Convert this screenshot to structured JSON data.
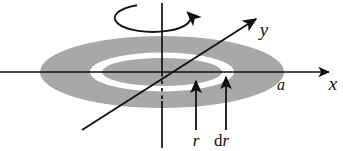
{
  "figure": {
    "width": 343,
    "height": 151,
    "background_color": "#ffffff"
  },
  "colors": {
    "disk_fill": "#a8a8a8",
    "ring_fill": "#ffffff",
    "line": "#111111",
    "text": "#111111"
  },
  "axes": {
    "x_axis": {
      "label": "x",
      "icon": "arrow-right-icon",
      "start": [
        0,
        72
      ],
      "end": [
        330,
        72
      ],
      "label_position": [
        333,
        90
      ]
    },
    "y_axis": {
      "label": "y",
      "icon": "arrow-up-right-icon",
      "start": [
        82,
        130
      ],
      "end": [
        258,
        18
      ],
      "label_position": [
        264,
        36
      ]
    },
    "z_axis": {
      "label": "",
      "icon": "vertical-axis-icon",
      "top": [
        162,
        3
      ],
      "bottom": [
        162,
        148
      ],
      "dashed_from": 74,
      "dashed_to": 100
    }
  },
  "disk": {
    "name": "shaded-disk",
    "center": [
      162,
      72
    ],
    "radius_x": 122,
    "radius_y": 36,
    "edge_label": "a",
    "edge_label_position": [
      281,
      90
    ]
  },
  "ring": {
    "name": "differential-annulus",
    "center": [
      162,
      72
    ],
    "outer_radius_x": 72,
    "outer_radius_y": 19.5,
    "inner_radius_x": 60,
    "inner_radius_y": 14,
    "fill": "#ffffff"
  },
  "rotation_indicator": {
    "name": "rotation-arrow",
    "icon": "rotation-arrow-icon",
    "center": [
      155,
      17
    ],
    "radius_x": 38,
    "radius_y": 14,
    "arrow_direction": "up-left"
  },
  "annotations": [
    {
      "id": "r",
      "label": "r",
      "label_upright_prefix": "",
      "icon": "arrow-up-icon",
      "arrow_tail": [
        196,
        130
      ],
      "arrow_head": [
        196,
        80
      ],
      "label_position": [
        191,
        146
      ]
    },
    {
      "id": "dr",
      "label": "r",
      "label_upright_prefix": "d",
      "icon": "arrow-up-icon",
      "arrow_tail": [
        226,
        130
      ],
      "arrow_head": [
        226,
        76
      ],
      "label_position": [
        216,
        146
      ]
    }
  ]
}
